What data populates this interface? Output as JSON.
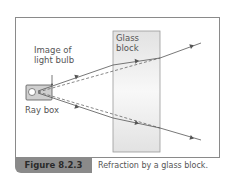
{
  "figure": {
    "labels": {
      "image_of_light_bulb_line1": "Image of",
      "image_of_light_bulb_line2": "light bulb",
      "ray_box": "Ray box",
      "glass_block_line1": "Glass",
      "glass_block_line2": "block"
    },
    "caption": {
      "number": "Figure 8.2.3",
      "text": "Refraction by a glass block."
    },
    "colors": {
      "frame": "#8a8a8a",
      "caption_tag": "#8a8a8a",
      "ray": "#555555",
      "glass": "#e4e4e4"
    }
  }
}
